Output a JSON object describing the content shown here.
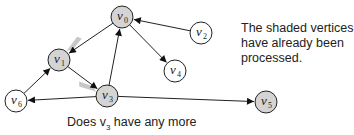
{
  "diagram": {
    "title": "",
    "nodes": [
      {
        "id": "v0",
        "label": "v",
        "sub": "0",
        "x": 122,
        "y": 17,
        "shaded": true
      },
      {
        "id": "v1",
        "label": "v",
        "sub": "1",
        "x": 59,
        "y": 60,
        "shaded": true
      },
      {
        "id": "v2",
        "label": "v",
        "sub": "2",
        "x": 201,
        "y": 33,
        "shaded": false
      },
      {
        "id": "v3",
        "label": "v",
        "sub": "3",
        "x": 107,
        "y": 96,
        "shaded": true
      },
      {
        "id": "v4",
        "label": "v",
        "sub": "4",
        "x": 175,
        "y": 71,
        "shaded": false
      },
      {
        "id": "v5",
        "label": "v",
        "sub": "5",
        "x": 266,
        "y": 102,
        "shaded": true
      },
      {
        "id": "v6",
        "label": "v",
        "sub": "6",
        "x": 16,
        "y": 101,
        "shaded": false
      }
    ],
    "edges": [
      {
        "from": "v0",
        "to": "v1",
        "highlighted": true
      },
      {
        "from": "v1",
        "to": "v3",
        "highlighted": true
      },
      {
        "from": "v3",
        "to": "v0",
        "highlighted": false
      },
      {
        "from": "v2",
        "to": "v0",
        "highlighted": false
      },
      {
        "from": "v0",
        "to": "v4",
        "highlighted": false
      },
      {
        "from": "v3",
        "to": "v6",
        "highlighted": false
      },
      {
        "from": "v6",
        "to": "v1",
        "highlighted": false
      },
      {
        "from": "v3",
        "to": "v5",
        "highlighted": false
      }
    ],
    "colors": {
      "shaded": "#d4d4d4",
      "unshaded": "#ffffff",
      "highlight": "#c8c8c8",
      "stroke": "#222222"
    }
  },
  "note": "The shaded vertices have already been processed.",
  "caption": {
    "prefix": "Does v",
    "sub": "3",
    "suffix": " have any more"
  }
}
